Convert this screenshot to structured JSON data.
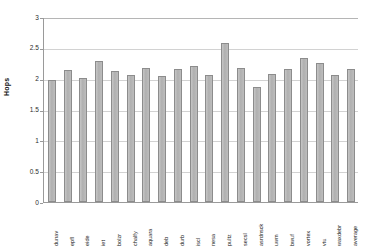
{
  "chart_data": {
    "type": "bar",
    "title": "",
    "xlabel": "",
    "ylabel": "Hops",
    "ylim": [
      0,
      3
    ],
    "yticks": [
      "0",
      "0.5",
      "1",
      "1.5",
      "2",
      "2.5",
      "3"
    ],
    "ytick_values": [
      0,
      0.5,
      1,
      1.5,
      2,
      2.5,
      3
    ],
    "grid": true,
    "legend": "none",
    "bar_color": "#b7b7b7",
    "bar_border_color": "#8c8c8c",
    "categories": [
      "dunav",
      "epfl",
      "eide",
      "iet",
      "bolzr",
      "chalfy",
      "aquara",
      "deb",
      "durb",
      "iscl",
      "nesa",
      "pultz",
      "secsl",
      "asrdnsck",
      "uwm",
      "bwuf",
      "vortex",
      "vtu",
      "waxdebr",
      "average"
    ],
    "values": [
      1.98,
      2.14,
      2.01,
      2.28,
      2.12,
      2.06,
      2.18,
      2.04,
      2.15,
      2.2,
      2.06,
      2.58,
      2.18,
      1.87,
      2.08,
      2.15,
      2.33,
      2.25,
      2.06,
      2.15
    ],
    "axis_color": "#9a9a9a",
    "gridline_color": "#d2d2d2"
  }
}
